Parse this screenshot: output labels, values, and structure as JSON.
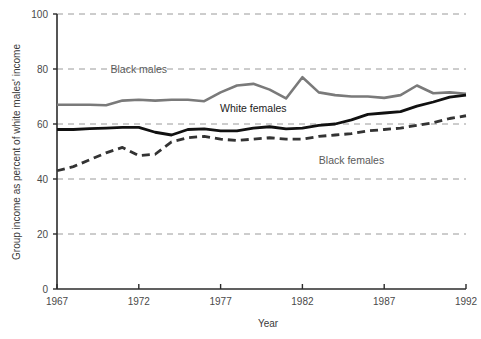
{
  "chart_data": {
    "type": "line",
    "title": "",
    "xlabel": "Year",
    "ylabel": "Group income as percent of white males' income",
    "xlim": [
      1967,
      1992
    ],
    "ylim": [
      0,
      100
    ],
    "xticks": [
      1967,
      1972,
      1977,
      1982,
      1987,
      1992
    ],
    "yticks": [
      0,
      20,
      40,
      60,
      80,
      100
    ],
    "grid": "horizontal-dashed",
    "legend": "inline-annotations",
    "x": [
      1967,
      1968,
      1969,
      1970,
      1971,
      1972,
      1973,
      1974,
      1975,
      1976,
      1977,
      1978,
      1979,
      1980,
      1981,
      1982,
      1983,
      1984,
      1985,
      1986,
      1987,
      1988,
      1989,
      1990,
      1991,
      1992
    ],
    "series": [
      {
        "name": "Black males",
        "style": "solid-gray",
        "color": "#7a7a7a",
        "width": 2.6,
        "label_x": 1972.0,
        "label_y": 78.5,
        "values": [
          67.0,
          67.0,
          67.0,
          66.8,
          68.5,
          68.8,
          68.5,
          68.8,
          68.8,
          68.3,
          71.5,
          74.0,
          74.6,
          72.5,
          69.3,
          77.0,
          71.5,
          70.5,
          70.0,
          70.0,
          69.5,
          70.5,
          74.0,
          71.2,
          71.5,
          71.0
        ]
      },
      {
        "name": "White females",
        "style": "solid-black",
        "color": "#111111",
        "width": 2.8,
        "label_x": 1979.0,
        "label_y": 64.5,
        "values": [
          58.0,
          58.0,
          58.3,
          58.5,
          58.8,
          58.8,
          57.0,
          56.0,
          58.0,
          58.2,
          57.5,
          57.5,
          58.5,
          59.0,
          58.2,
          58.5,
          59.5,
          60.0,
          61.5,
          63.5,
          64.0,
          64.5,
          66.5,
          68.0,
          69.8,
          70.5
        ]
      },
      {
        "name": "Black females",
        "style": "dashed-black",
        "color": "#333333",
        "width": 2.8,
        "label_x": 1985.0,
        "label_y": 45.5,
        "values": [
          43.0,
          44.5,
          47.0,
          49.5,
          51.5,
          48.5,
          49.0,
          53.5,
          55.0,
          55.5,
          54.5,
          54.0,
          54.5,
          55.0,
          54.5,
          54.5,
          55.5,
          56.0,
          56.5,
          57.5,
          58.0,
          58.5,
          59.5,
          60.5,
          62.0,
          63.0
        ]
      }
    ]
  },
  "axis": {
    "y_title": "Group income as percent of white males' income",
    "x_title": "Year",
    "y_tick_labels": [
      "0",
      "20",
      "40",
      "60",
      "80",
      "100"
    ],
    "x_tick_labels": [
      "1967",
      "1972",
      "1977",
      "1982",
      "1987",
      "1992"
    ]
  },
  "annotations": {
    "black_males": "Black males",
    "white_females": "White females",
    "black_females": "Black females"
  },
  "colors": {
    "black_males": "#7a7a7a",
    "white_females": "#111111",
    "black_females": "#333333",
    "grid": "#9a9a9a",
    "axis": "#2b2b2b",
    "background": "#ffffff"
  }
}
